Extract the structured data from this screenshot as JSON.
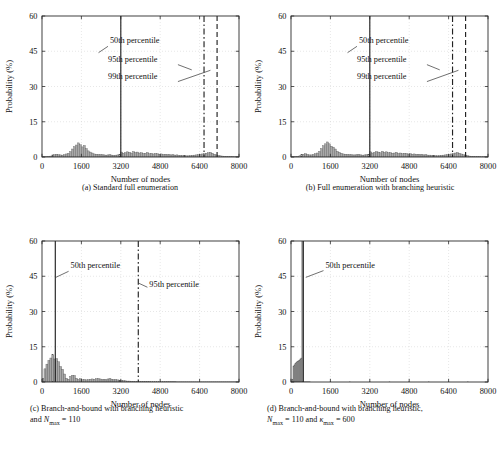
{
  "figure": {
    "axis_labels": {
      "x": "Number of nodes",
      "y": "Probability (%)"
    },
    "xticks": [
      "0",
      "1600",
      "3200",
      "4800",
      "6400",
      "8000"
    ],
    "yticks": [
      "0",
      "15",
      "30",
      "45",
      "60"
    ],
    "xlim": [
      0,
      8000
    ],
    "ylim": [
      0,
      60
    ],
    "colors": {
      "bar_fill": "#a8a8a8",
      "bar_edge": "#555555",
      "axis": "#2b2b2b",
      "grid": "#cfcfcf",
      "percentile_line": "#222222",
      "annotation_text": "#111111"
    },
    "panels": [
      {
        "id": "a",
        "caption_lines": [
          "(a) Standard full enumeration"
        ],
        "annotations": [
          {
            "label": "50th percentile",
            "style": "solid"
          },
          {
            "label": "95th percentile",
            "style": "dashdot"
          },
          {
            "label": "99th percentile",
            "style": "dashed"
          }
        ]
      },
      {
        "id": "b",
        "caption_lines": [
          "(b) Full enumeration with branching heuristic"
        ],
        "annotations": [
          {
            "label": "50th percentile",
            "style": "solid"
          },
          {
            "label": "95th percentile",
            "style": "dashdot"
          },
          {
            "label": "99th percentile",
            "style": "dashed"
          }
        ]
      },
      {
        "id": "c",
        "caption_lines": [
          "(c) Branch-and-bound with branching heuristic",
          "and Nmax = 110"
        ],
        "annotations": [
          {
            "label": "50th percentile",
            "style": "solid"
          },
          {
            "label": "95th percentile",
            "style": "dashdot"
          }
        ]
      },
      {
        "id": "d",
        "caption_lines": [
          "(d) Branch-and-bound with branching heuristic,",
          "Nmax = 110 and kappamax = 600"
        ],
        "annotations": [
          {
            "label": "50th percentile",
            "style": "solid"
          }
        ]
      }
    ]
  },
  "chart_data": [
    {
      "type": "bar",
      "panel": "a",
      "title": "(a) Standard full enumeration",
      "xlabel": "Number of nodes",
      "ylabel": "Probability (%)",
      "xlim": [
        0,
        8000
      ],
      "ylim": [
        0,
        60
      ],
      "xticks": [
        0,
        1600,
        3200,
        4800,
        6400,
        8000
      ],
      "yticks": [
        0,
        15,
        30,
        45,
        60
      ],
      "grid": true,
      "legend": "none",
      "bin_width": 80,
      "bin_centers": [
        40,
        120,
        200,
        280,
        360,
        440,
        520,
        600,
        680,
        760,
        840,
        920,
        1000,
        1080,
        1160,
        1240,
        1320,
        1400,
        1480,
        1560,
        1640,
        1720,
        1800,
        1880,
        1960,
        2040,
        2120,
        2200,
        2280,
        2360,
        2440,
        2520,
        2600,
        2680,
        2760,
        2840,
        2920,
        3000,
        3080,
        3160,
        3240,
        3320,
        3400,
        3480,
        3560,
        3640,
        3720,
        3800,
        3880,
        3960,
        4040,
        4120,
        4200,
        4280,
        4360,
        4440,
        4520,
        4600,
        4680,
        4760,
        4840,
        4920,
        5000,
        5080,
        5160,
        5240,
        5320,
        5400,
        5480,
        5560,
        5640,
        5720,
        5800,
        5880,
        5960,
        6040,
        6120,
        6200,
        6280,
        6360,
        6440,
        6520,
        6600,
        6680,
        6760,
        6840,
        6920,
        7000,
        7080,
        7160,
        7240,
        7320,
        7400,
        7480,
        7560,
        7640,
        7720,
        7800,
        7880,
        7960
      ],
      "values": [
        0.1,
        0.1,
        0.2,
        0.3,
        0.4,
        0.9,
        1.0,
        1.2,
        1.0,
        0.9,
        0.8,
        1.0,
        1.3,
        1.6,
        2.3,
        3.4,
        4.4,
        5.1,
        6.0,
        5.2,
        4.3,
        4.9,
        3.6,
        2.6,
        2.1,
        1.7,
        1.3,
        1.2,
        1.1,
        1.0,
        1.0,
        0.9,
        0.8,
        0.9,
        1.0,
        0.8,
        0.7,
        0.8,
        0.9,
        1.0,
        2.1,
        1.6,
        1.9,
        2.2,
        2.0,
        1.7,
        2.3,
        1.9,
        2.1,
        1.7,
        1.8,
        1.5,
        1.6,
        1.9,
        1.4,
        1.6,
        1.3,
        1.5,
        1.4,
        1.2,
        1.3,
        1.1,
        1.2,
        1.0,
        1.1,
        0.9,
        1.0,
        0.8,
        0.9,
        0.7,
        0.7,
        0.6,
        0.6,
        0.5,
        0.5,
        0.6,
        0.7,
        0.8,
        0.9,
        1.0,
        1.1,
        1.3,
        1.4,
        1.6,
        1.8,
        2.0,
        1.6,
        1.2,
        0.9,
        0.7,
        0.5,
        0.4,
        0.3,
        0.3,
        0.2,
        0.2,
        0.2,
        0.1,
        0.1,
        0.1
      ],
      "percentiles": [
        {
          "label": "50th percentile",
          "value": 3200,
          "style": "solid"
        },
        {
          "label": "95th percentile",
          "value": 6580,
          "style": "dashdot"
        },
        {
          "label": "99th percentile",
          "value": 7110,
          "style": "dashed"
        }
      ]
    },
    {
      "type": "bar",
      "panel": "b",
      "title": "(b) Full enumeration with branching heuristic",
      "xlabel": "Number of nodes",
      "ylabel": "Probability (%)",
      "xlim": [
        0,
        8000
      ],
      "ylim": [
        0,
        60
      ],
      "xticks": [
        0,
        1600,
        3200,
        4800,
        6400,
        8000
      ],
      "yticks": [
        0,
        15,
        30,
        45,
        60
      ],
      "grid": true,
      "legend": "none",
      "bin_width": 80,
      "bin_centers": [
        40,
        120,
        200,
        280,
        360,
        440,
        520,
        600,
        680,
        760,
        840,
        920,
        1000,
        1080,
        1160,
        1240,
        1320,
        1400,
        1480,
        1560,
        1640,
        1720,
        1800,
        1880,
        1960,
        2040,
        2120,
        2200,
        2280,
        2360,
        2440,
        2520,
        2600,
        2680,
        2760,
        2840,
        2920,
        3000,
        3080,
        3160,
        3240,
        3320,
        3400,
        3480,
        3560,
        3640,
        3720,
        3800,
        3880,
        3960,
        4040,
        4120,
        4200,
        4280,
        4360,
        4440,
        4520,
        4600,
        4680,
        4760,
        4840,
        4920,
        5000,
        5080,
        5160,
        5240,
        5320,
        5400,
        5480,
        5560,
        5640,
        5720,
        5800,
        5880,
        5960,
        6040,
        6120,
        6200,
        6280,
        6360,
        6440,
        6520,
        6600,
        6680,
        6760,
        6840,
        6920,
        7000,
        7080,
        7160,
        7240,
        7320,
        7400,
        7480,
        7560,
        7640,
        7720,
        7800,
        7880,
        7960
      ],
      "values": [
        0.1,
        0.1,
        0.2,
        0.3,
        0.5,
        1.0,
        1.2,
        1.4,
        1.1,
        0.9,
        0.9,
        1.1,
        1.4,
        1.7,
        2.4,
        3.6,
        4.8,
        5.6,
        6.4,
        5.6,
        4.6,
        4.2,
        3.4,
        2.4,
        2.0,
        1.6,
        1.3,
        1.2,
        1.1,
        1.0,
        1.0,
        0.9,
        0.9,
        1.0,
        1.1,
        0.9,
        0.8,
        0.9,
        1.0,
        1.1,
        2.2,
        1.7,
        2.0,
        2.3,
        2.1,
        1.8,
        2.4,
        2.0,
        2.2,
        1.8,
        1.9,
        1.6,
        1.7,
        2.0,
        1.5,
        1.7,
        1.4,
        1.6,
        1.5,
        1.3,
        1.4,
        1.2,
        1.3,
        1.1,
        1.2,
        1.0,
        1.1,
        0.9,
        1.0,
        0.8,
        0.8,
        0.7,
        0.6,
        0.6,
        0.5,
        0.6,
        0.7,
        0.8,
        0.9,
        1.0,
        1.1,
        1.3,
        1.5,
        1.7,
        1.9,
        1.6,
        1.3,
        1.0,
        0.8,
        0.6,
        0.4,
        0.3,
        0.3,
        0.2,
        0.2,
        0.2,
        0.1,
        0.1,
        0.1,
        0.1
      ],
      "percentiles": [
        {
          "label": "50th percentile",
          "value": 3200,
          "style": "solid"
        },
        {
          "label": "95th percentile",
          "value": 6560,
          "style": "dashdot"
        },
        {
          "label": "99th percentile",
          "value": 7090,
          "style": "dashed"
        }
      ]
    },
    {
      "type": "bar",
      "panel": "c",
      "title": "(c) Branch-and-bound with branching heuristic and Nmax = 110",
      "xlabel": "Number of nodes",
      "ylabel": "Probability (%)",
      "xlim": [
        0,
        8000
      ],
      "ylim": [
        0,
        60
      ],
      "xticks": [
        0,
        1600,
        3200,
        4800,
        6400,
        8000
      ],
      "yticks": [
        0,
        15,
        30,
        45,
        60
      ],
      "grid": true,
      "legend": "none",
      "bin_width": 80,
      "bin_centers": [
        40,
        120,
        200,
        280,
        360,
        440,
        520,
        600,
        680,
        760,
        840,
        920,
        1000,
        1080,
        1160,
        1240,
        1320,
        1400,
        1480,
        1560,
        1640,
        1720,
        1800,
        1880,
        1960,
        2040,
        2120,
        2200,
        2280,
        2360,
        2440,
        2520,
        2600,
        2680,
        2760,
        2840,
        2920,
        3000,
        3080,
        3160,
        3240,
        3320,
        3400,
        3480,
        3560,
        3640,
        3720,
        3800,
        3880,
        3960,
        4040,
        4120,
        4200,
        4280,
        4360,
        4440,
        4520,
        4600,
        4680,
        4760,
        4840,
        4920,
        5000,
        5080,
        5160,
        5240,
        5320,
        5400,
        5480,
        5560,
        5640,
        5720,
        5800,
        5880,
        5960,
        6040,
        6120,
        6200,
        6280,
        6360,
        6440,
        6520,
        6600,
        6680,
        6760,
        6840,
        6920,
        7000,
        7080,
        7160,
        7240,
        7320,
        7400,
        7480,
        7560,
        7640,
        7720,
        7800,
        7880,
        7960
      ],
      "values": [
        1.6,
        5.6,
        7.6,
        9.2,
        10.2,
        11.6,
        9.8,
        10.0,
        8.6,
        6.6,
        5.4,
        3.4,
        1.6,
        1.2,
        2.4,
        2.9,
        2.8,
        1.6,
        1.1,
        1.4,
        1.0,
        1.1,
        0.9,
        1.0,
        1.2,
        1.3,
        1.2,
        1.4,
        1.5,
        1.3,
        1.1,
        1.2,
        1.0,
        1.3,
        1.5,
        1.2,
        1.0,
        1.1,
        0.9,
        0.8,
        0.7,
        0.6,
        0.5,
        0.4,
        0.4,
        0.3,
        0.3,
        0.2,
        0.2,
        0.2,
        0.2,
        0.2,
        0.2,
        0.2,
        0.2,
        0.1,
        0.1,
        0.1,
        0.1,
        0.1,
        0.1,
        0.1,
        0.1,
        0.1,
        0.1,
        0.1,
        0.1,
        0.1,
        0.05,
        0.05,
        0.05,
        0.05,
        0.05,
        0.05,
        0.05,
        0.05,
        0.05,
        0.05,
        0.05,
        0.05,
        0.05,
        0.05,
        0.05,
        0.05,
        0.05,
        0.05,
        0.05,
        0.05,
        0.05,
        0.05,
        0.05,
        0.05,
        0.05,
        0.05,
        0.05,
        0.05,
        0.05,
        0.05,
        0.05,
        0.05
      ],
      "percentiles": [
        {
          "label": "50th percentile",
          "value": 540,
          "style": "solid"
        },
        {
          "label": "95th percentile",
          "value": 3910,
          "style": "dashdot"
        }
      ]
    },
    {
      "type": "bar",
      "panel": "d",
      "title": "(d) Branch-and-bound with branching heuristic, Nmax = 110 and kappamax = 600",
      "xlabel": "Number of nodes",
      "ylabel": "Probability (%)",
      "xlim": [
        0,
        8000
      ],
      "ylim": [
        0,
        60
      ],
      "xticks": [
        0,
        1600,
        3200,
        4800,
        6400,
        8000
      ],
      "yticks": [
        0,
        15,
        30,
        45,
        60
      ],
      "grid": true,
      "legend": "none",
      "bin_width": 40,
      "bin_centers": [
        20,
        60,
        100,
        140,
        180,
        220,
        260,
        300,
        340,
        380,
        420,
        460,
        500,
        540,
        580,
        620,
        660,
        700,
        740,
        780,
        1600,
        2400,
        3200,
        4000,
        4800,
        5600,
        6400,
        7200
      ],
      "values": [
        0.4,
        1.2,
        6.8,
        7.3,
        7.8,
        8.2,
        8.6,
        9.0,
        9.3,
        9.8,
        10.2,
        60.0,
        0.1,
        0.05,
        0.05,
        0.05,
        0.05,
        0.05,
        0.05,
        0.05,
        0.05,
        0.05,
        0.05,
        0.05,
        0.05,
        0.05,
        0.05,
        0.05
      ],
      "clipped_bar_note": "tall bar at ~x=460 extends beyond ylim top (60%)",
      "percentiles": [
        {
          "label": "50th percentile",
          "value": 500,
          "style": "solid"
        }
      ]
    }
  ]
}
